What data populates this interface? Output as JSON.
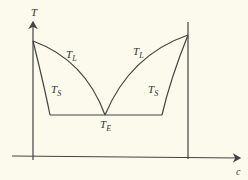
{
  "diagram": {
    "type": "eutectic phase diagram",
    "axes": {
      "y_label": "T",
      "x_label": "c"
    },
    "curves": {
      "liquidus_left": "T_L",
      "liquidus_right": "T_L",
      "solidus_left": "T_S",
      "solidus_right": "T_S",
      "eutectic": "T_E"
    },
    "labels": {
      "T": "T",
      "c": "c",
      "TL_left_main": "T",
      "TL_left_sub": "L",
      "TL_right_main": "T",
      "TL_right_sub": "L",
      "TS_left_main": "T",
      "TS_left_sub": "S",
      "TS_right_main": "T",
      "TS_right_sub": "S",
      "TE_main": "T",
      "TE_sub": "E"
    },
    "colors": {
      "background": "#fbfaec",
      "line": "#444444"
    }
  }
}
